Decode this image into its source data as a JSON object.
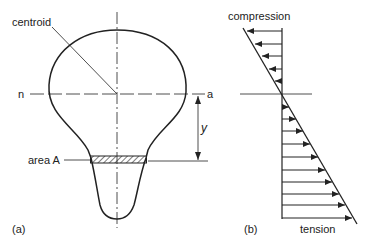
{
  "figure": {
    "panel_a": {
      "label": "(a)",
      "centroid_label": "centroid",
      "neutral_axis_left": "n",
      "neutral_axis_right": "a",
      "area_label": "area A",
      "distance_label": "y"
    },
    "panel_b": {
      "label": "(b)",
      "top_label": "compression",
      "bottom_label": "tension",
      "compression_arrow_count": 5,
      "tension_arrow_count": 10
    },
    "colors": {
      "stroke": "#222222",
      "background": "#ffffff"
    }
  }
}
